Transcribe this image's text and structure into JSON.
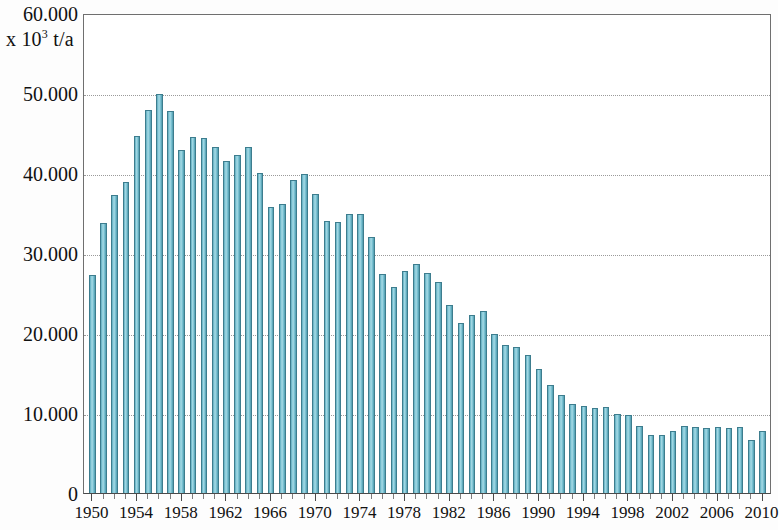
{
  "chart_data": {
    "type": "bar",
    "title": "",
    "subtitle": "",
    "xlabel": "",
    "ylabel": "x 10³ t/a",
    "ylabel_prefix": "x 10",
    "ylabel_exponent": "3",
    "ylabel_suffix": " t/a",
    "ylim": [
      0,
      60000
    ],
    "xlim": [
      1950,
      2010
    ],
    "grid": true,
    "grid_axis": "y",
    "legend": false,
    "legend_position": "none",
    "bar_color": "#7ec4d4",
    "bar_edge_color": "#3d7d8e",
    "axis_color": "#4a4a4a",
    "gridline_color": "#9a9a9a",
    "y_ticks": [
      0,
      10000,
      20000,
      30000,
      40000,
      50000,
      60000
    ],
    "y_tick_labels": [
      "0",
      "10.000",
      "20.000",
      "30.000",
      "40.000",
      "50.000",
      "60.000"
    ],
    "x_tick_labels": [
      "1950",
      "1954",
      "1958",
      "1962",
      "1966",
      "1970",
      "1974",
      "1978",
      "1982",
      "1986",
      "1990",
      "1994",
      "1998",
      "2002",
      "2006",
      "2010"
    ],
    "x_tick_step": 4,
    "categories": [
      "1950",
      "1951",
      "1952",
      "1953",
      "1954",
      "1955",
      "1956",
      "1957",
      "1958",
      "1959",
      "1960",
      "1961",
      "1962",
      "1963",
      "1964",
      "1965",
      "1966",
      "1967",
      "1968",
      "1969",
      "1970",
      "1971",
      "1972",
      "1973",
      "1974",
      "1975",
      "1976",
      "1977",
      "1978",
      "1979",
      "1980",
      "1981",
      "1982",
      "1983",
      "1984",
      "1985",
      "1986",
      "1987",
      "1988",
      "1989",
      "1990",
      "1991",
      "1992",
      "1993",
      "1994",
      "1995",
      "1996",
      "1997",
      "1998",
      "1999",
      "2000",
      "2001",
      "2002",
      "2003",
      "2004",
      "2005",
      "2006",
      "2007",
      "2008",
      "2009",
      "2010"
    ],
    "values": [
      27300,
      33700,
      37200,
      38900,
      44600,
      47900,
      49900,
      47700,
      42900,
      44500,
      44400,
      43300,
      41500,
      42200,
      43200,
      40000,
      35700,
      36100,
      39100,
      39900,
      37400,
      34000,
      33900,
      34900,
      34900,
      32000,
      27400,
      25800,
      27800,
      28600,
      27500,
      26400,
      23500,
      21200,
      22300,
      22700,
      19900,
      18500,
      18300,
      17200,
      15500,
      13500,
      12300,
      11100,
      10900,
      10600,
      10700,
      9900,
      9700,
      8400,
      7200,
      7300,
      7800,
      8400,
      8200,
      8100,
      8200,
      8100,
      8200,
      6600,
      7800
    ]
  }
}
